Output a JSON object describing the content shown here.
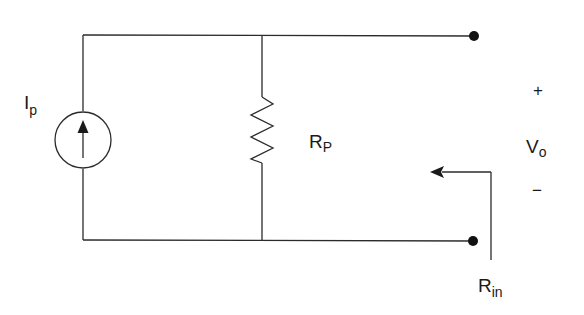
{
  "diagram": {
    "type": "circuit-schematic",
    "colors": {
      "line": "#2b2b2b",
      "text": "#1a1a1a",
      "background": "#ffffff"
    },
    "components": {
      "current_source": {
        "label": "I",
        "subscript": "p",
        "direction": "up"
      },
      "resistor": {
        "label": "R",
        "subscript": "P"
      },
      "output_voltage": {
        "label": "V",
        "subscript": "o",
        "plus": "+",
        "minus": "−"
      },
      "input_resistance": {
        "label": "R",
        "subscript": "in"
      }
    },
    "terminals": [
      "top-output-terminal",
      "bottom-output-terminal"
    ]
  }
}
